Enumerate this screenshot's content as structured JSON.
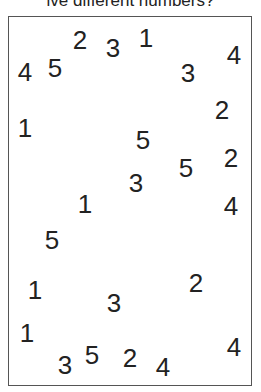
{
  "question": "How many five different numbers?",
  "question_visible": "ive different numbers?",
  "digits": [
    {
      "value": "4",
      "x": 25,
      "y": 72
    },
    {
      "value": "5",
      "x": 55,
      "y": 68
    },
    {
      "value": "2",
      "x": 80,
      "y": 40
    },
    {
      "value": "3",
      "x": 113,
      "y": 48
    },
    {
      "value": "1",
      "x": 146,
      "y": 38
    },
    {
      "value": "3",
      "x": 188,
      "y": 73
    },
    {
      "value": "4",
      "x": 234,
      "y": 55
    },
    {
      "value": "1",
      "x": 25,
      "y": 128
    },
    {
      "value": "2",
      "x": 222,
      "y": 110
    },
    {
      "value": "5",
      "x": 143,
      "y": 140
    },
    {
      "value": "5",
      "x": 186,
      "y": 168
    },
    {
      "value": "2",
      "x": 231,
      "y": 158
    },
    {
      "value": "3",
      "x": 136,
      "y": 183
    },
    {
      "value": "1",
      "x": 85,
      "y": 204
    },
    {
      "value": "4",
      "x": 231,
      "y": 206
    },
    {
      "value": "5",
      "x": 52,
      "y": 240
    },
    {
      "value": "1",
      "x": 35,
      "y": 290
    },
    {
      "value": "2",
      "x": 196,
      "y": 283
    },
    {
      "value": "3",
      "x": 114,
      "y": 303
    },
    {
      "value": "1",
      "x": 27,
      "y": 333
    },
    {
      "value": "3",
      "x": 65,
      "y": 365
    },
    {
      "value": "5",
      "x": 92,
      "y": 355
    },
    {
      "value": "2",
      "x": 130,
      "y": 358
    },
    {
      "value": "4",
      "x": 163,
      "y": 367
    },
    {
      "value": "4",
      "x": 234,
      "y": 347
    }
  ]
}
